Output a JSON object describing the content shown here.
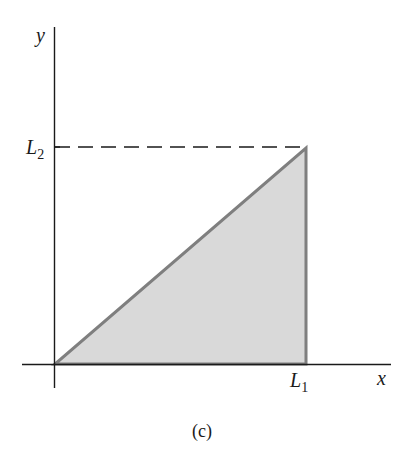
{
  "diagram": {
    "axes": {
      "x_label": "x",
      "y_label": "y"
    },
    "labels": {
      "L1": {
        "base": "L",
        "sub": "1"
      },
      "L2": {
        "base": "L",
        "sub": "2"
      }
    },
    "caption": "(c)",
    "region": {
      "shape": "triangle",
      "vertices": [
        "(0,0)",
        "(L1,0)",
        "(L1,L2)"
      ],
      "fill": "#d9d9d9",
      "stroke": "#7a7a7a"
    },
    "guide": {
      "style": "dashed",
      "from": "(0,L2)",
      "to": "(L1,L2)"
    }
  }
}
